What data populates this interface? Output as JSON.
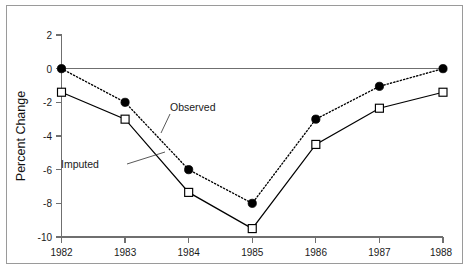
{
  "chart_data": {
    "type": "line",
    "title": "",
    "subtitle": "",
    "xlabel": "",
    "ylabel": "Percent Change",
    "x": [
      1982,
      1983,
      1984,
      1985,
      1986,
      1987,
      1988
    ],
    "categories": [
      "1982",
      "1983",
      "1984",
      "1985",
      "1986",
      "1987",
      "1988"
    ],
    "xlim": [
      1982,
      1988
    ],
    "ylim": [
      -10,
      2
    ],
    "yticks": [
      2,
      0,
      -2,
      -4,
      -6,
      -8,
      -10
    ],
    "ytick_labels": [
      "2",
      "0",
      "-2",
      "-4",
      "-6",
      "-8",
      "-10"
    ],
    "xtick_labels": [
      "1982",
      "1983",
      "1984",
      "1985",
      "1986",
      "1987",
      "1988"
    ],
    "grid": false,
    "legend": "inline-annotations",
    "series": [
      {
        "name": "Observed",
        "marker": "filled-circle",
        "linestyle": "dotted",
        "color": "#000000",
        "values": [
          0.0,
          -2.0,
          -6.0,
          -8.0,
          -3.0,
          -1.05,
          0.0
        ]
      },
      {
        "name": "Imputed",
        "marker": "open-square",
        "linestyle": "solid",
        "color": "#000000",
        "values": [
          -1.4,
          -3.0,
          -7.35,
          -9.5,
          -4.5,
          -2.35,
          -1.4
        ]
      }
    ],
    "annotations": [
      {
        "text": "Observed",
        "series": "Observed"
      },
      {
        "text": "Imputed",
        "series": "Imputed"
      }
    ]
  },
  "axes": {
    "y_title": "Percent Change"
  },
  "annotations": {
    "observed_label": "Observed",
    "imputed_label": "Imputed"
  },
  "colors": {
    "line": "#000000",
    "axis": "#6f6f6f",
    "frame": "#9a9a9a",
    "background": "#ffffff"
  }
}
